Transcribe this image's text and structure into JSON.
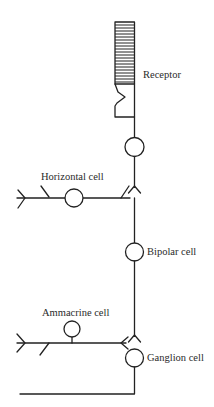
{
  "diagram": {
    "colors": {
      "line": "#222222",
      "background": "#ffffff",
      "text": "#2a2a2a"
    },
    "labels": {
      "receptor": "Receptor",
      "horizontal": "Horizontal cell",
      "bipolar": "Bipolar cell",
      "amacrine": "Ammacrine cell",
      "ganglion": "Ganglion cell"
    },
    "nodes": [
      {
        "id": "receptor",
        "type": "photoreceptor",
        "label": "Receptor",
        "outer_segment_discs": 21
      },
      {
        "id": "receptor-body",
        "type": "cell-body",
        "label": "Receptor"
      },
      {
        "id": "horizontal",
        "type": "cell-body",
        "label": "Horizontal cell"
      },
      {
        "id": "bipolar",
        "type": "cell-body",
        "label": "Bipolar cell"
      },
      {
        "id": "amacrine",
        "type": "cell-body",
        "label": "Ammacrine cell"
      },
      {
        "id": "ganglion",
        "type": "cell-body",
        "label": "Ganglion cell"
      }
    ],
    "edges": [
      {
        "from": "receptor",
        "to": "receptor-body",
        "kind": "axon"
      },
      {
        "from": "receptor-body",
        "to": "bipolar",
        "kind": "synapse"
      },
      {
        "from": "receptor-body",
        "to": "horizontal",
        "kind": "synapse"
      },
      {
        "from": "bipolar",
        "to": "ganglion",
        "kind": "synapse"
      },
      {
        "from": "amacrine",
        "to": "ganglion",
        "kind": "synapse"
      },
      {
        "from": "ganglion",
        "to": "output",
        "kind": "axon"
      }
    ]
  }
}
